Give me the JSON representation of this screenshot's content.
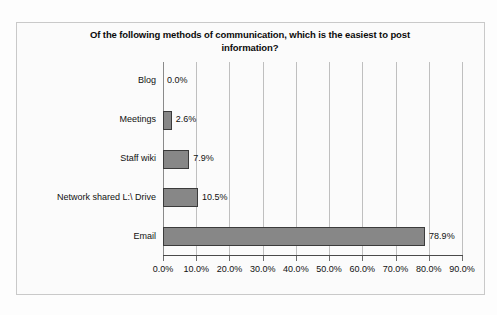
{
  "chart_data": {
    "type": "bar",
    "orientation": "horizontal",
    "title": "Of the following methods of communication, which is the easiest to post information?",
    "title_line1": "Of the following methods of communication, which is the easiest to post",
    "title_line2": "information?",
    "xlabel": "",
    "ylabel": "",
    "categories": [
      "Blog",
      "Meetings",
      "Staff wiki",
      "Network shared L:\\ Drive",
      "Email"
    ],
    "values": [
      0.0,
      2.6,
      7.9,
      10.5,
      78.9
    ],
    "data_labels": [
      "0.0%",
      "2.6%",
      "7.9%",
      "10.5%",
      "78.9%"
    ],
    "xlim": [
      0,
      90
    ],
    "xticks": [
      0,
      10,
      20,
      30,
      40,
      50,
      60,
      70,
      80,
      90
    ],
    "xtick_labels": [
      "0.0%",
      "10.0%",
      "20.0%",
      "30.0%",
      "40.0%",
      "50.0%",
      "60.0%",
      "70.0%",
      "80.0%",
      "90.0%"
    ],
    "grid": true,
    "grid_axis": "x",
    "legend": false,
    "colors": {
      "bar_fill": "#878787",
      "bar_border": "#3b3b3b",
      "gridline": "#bfbfbf",
      "axis": "#4a4a4a",
      "plot_background": "#fbfbfb",
      "frame_border": "#c9c9c9",
      "text": "#111111"
    }
  }
}
